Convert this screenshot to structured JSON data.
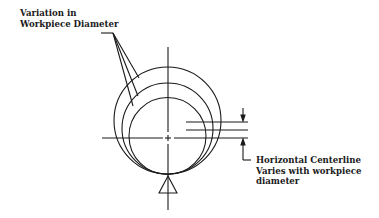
{
  "diagram": {
    "labels": {
      "variation_line1": "Variation in",
      "variation_line2": "Workpiece Diameter",
      "centerline_line1": "Horizontal Centerline",
      "centerline_line2": "Varies with workpiece",
      "centerline_line3": "diameter"
    },
    "circles": [
      {
        "name": "large-workpiece",
        "cx": 167.5,
        "cy": 120.5,
        "r": 53.5
      },
      {
        "name": "medium-workpiece",
        "cx": 167.5,
        "cy": 128.5,
        "r": 45.5
      },
      {
        "name": "small-workpiece",
        "cx": 167.5,
        "cy": 136,
        "r": 38.5
      }
    ],
    "support": "triangle-v-block",
    "line_color": "#1a1a1a"
  }
}
